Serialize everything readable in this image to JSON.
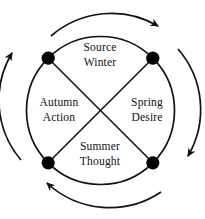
{
  "diagram": {
    "type": "cyclical-quadrant-diagram",
    "stroke_color": "#111111",
    "fill_color": "#ffffff",
    "dot_color": "#000000",
    "quadrants": [
      {
        "position": "north",
        "season": "Winter",
        "concept": "Source",
        "line1": "Source",
        "line2": "Winter"
      },
      {
        "position": "east",
        "season": "Spring",
        "concept": "Desire",
        "line1": "Spring",
        "line2": "Desire"
      },
      {
        "position": "south",
        "season": "Summer",
        "concept": "Thought",
        "line1": "Summer",
        "line2": "Thought"
      },
      {
        "position": "west",
        "season": "Autumn",
        "concept": "Action",
        "line1": "Autumn",
        "line2": "Action"
      }
    ],
    "nodes": [
      {
        "name": "node-northwest",
        "angle_deg": 135
      },
      {
        "name": "node-northeast",
        "angle_deg": 45
      },
      {
        "name": "node-southeast",
        "angle_deg": 315
      },
      {
        "name": "node-southwest",
        "angle_deg": 225
      }
    ],
    "arrows": [
      {
        "name": "arrow-top",
        "direction": "clockwise",
        "points_to": "east"
      },
      {
        "name": "arrow-right",
        "direction": "clockwise",
        "points_to": "south"
      },
      {
        "name": "arrow-bottom",
        "direction": "clockwise",
        "points_to": "west"
      },
      {
        "name": "arrow-left",
        "direction": "clockwise",
        "points_to": "north"
      }
    ]
  }
}
